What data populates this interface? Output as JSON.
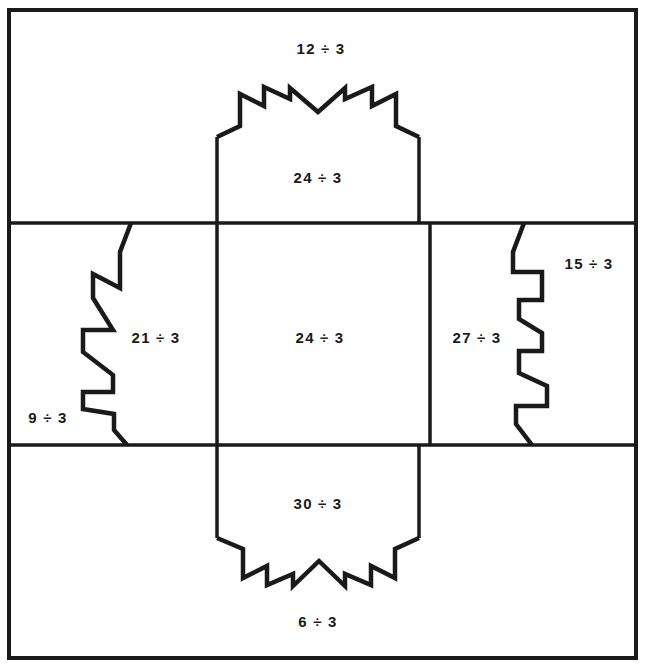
{
  "worksheet": {
    "title": "Division by 3 box-net puzzle",
    "divisor": 3,
    "stroke_color": "#1a1a1a",
    "background_color": "#ffffff",
    "border": {
      "x": 9,
      "y": 10,
      "width": 627,
      "height": 648,
      "stroke_width": 4
    },
    "grid": {
      "vertical_lines_x": [
        217,
        430
      ],
      "horizontal_lines_y": [
        223,
        445
      ],
      "stroke_width": 3.5
    },
    "flap_stroke_width": 4.5
  },
  "labels": [
    {
      "id": "top-outer",
      "text": "12 ÷ 3",
      "x": 321,
      "y": 48,
      "region": "top-outer-panel"
    },
    {
      "id": "top-flap",
      "text": "24 ÷ 3",
      "x": 318,
      "y": 177,
      "region": "top-flap"
    },
    {
      "id": "left-outer",
      "text": "9 ÷ 3",
      "x": 48,
      "y": 417,
      "region": "left-outer-panel"
    },
    {
      "id": "left-flap",
      "text": "21 ÷ 3",
      "x": 156,
      "y": 337,
      "region": "left-flap"
    },
    {
      "id": "center",
      "text": "24 ÷ 3",
      "x": 320,
      "y": 337,
      "region": "center-panel"
    },
    {
      "id": "right-flap",
      "text": "27 ÷ 3",
      "x": 477,
      "y": 337,
      "region": "right-flap"
    },
    {
      "id": "right-outer",
      "text": "15 ÷ 3",
      "x": 589,
      "y": 263,
      "region": "right-outer-panel"
    },
    {
      "id": "bottom-flap",
      "text": "30 ÷ 3",
      "x": 318,
      "y": 503,
      "region": "bottom-flap"
    },
    {
      "id": "bottom-outer",
      "text": "6 ÷ 3",
      "x": 318,
      "y": 621,
      "region": "bottom-outer-panel"
    }
  ],
  "shapes": {
    "top_flap_path": "M 217,223 L 217,137 L 240,126 L 240,94 L 264,106 L 264,87 L 290,99 L 290,88 L 318,112 L 345,88 L 345,99 L 372,87 L 372,106 L 396,94 L 396,126 L 419,137 L 419,223",
    "bottom_flap_path": "M 217,445 L 217,538 L 243,549 L 243,578 L 267,566 L 267,585 L 293,574 L 293,586 L 319,561 L 345,586 L 345,574 L 371,585 L 371,566 L 395,578 L 395,549 L 419,538 L 419,445",
    "left_flap_path": "M 217,223 L 131,223 L 120,250 L 120,288 L 94,274 L 94,297 L 112,329 L 84,329 L 84,352 L 112,375 L 112,390 L 84,390 L 84,408 L 112,413 L 112,430 L 126,445 L 217,445",
    "right_flap_path": "M 430,223 L 525,223 L 514,250 L 514,271 L 541,271 L 541,300 L 519,300 L 519,318 L 541,332 L 541,350 L 519,350 L 519,372 L 546,385 L 546,405 L 516,405 L 516,423 L 532,445 L 430,445"
  }
}
